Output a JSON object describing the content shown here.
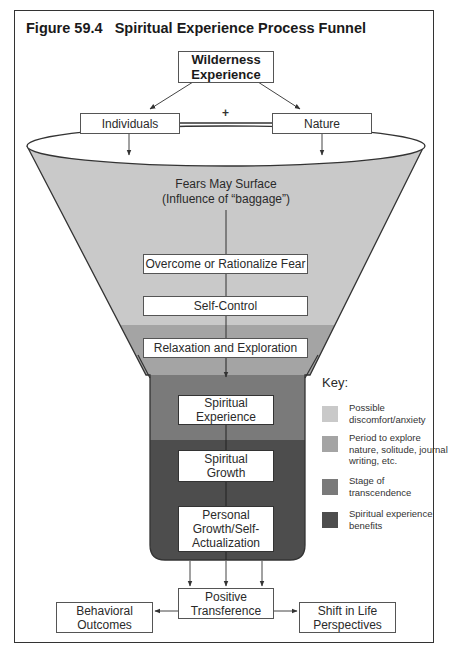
{
  "figure": {
    "title": "Figure 59.4   Spiritual Experience Process Funnel"
  },
  "top": {
    "source": "Wilderness\nExperience",
    "left_input": "Individuals",
    "right_input": "Nature",
    "combiner": "+"
  },
  "funnel": {
    "fears": "Fears May Surface\n(Influence of “baggage”)",
    "stages": [
      {
        "label": "Overcome or Rationalize Fear"
      },
      {
        "label": "Self-Control"
      },
      {
        "label": "Relaxation and Exploration"
      },
      {
        "label": "Spiritual\nExperience"
      },
      {
        "label": "Spiritual\nGrowth"
      },
      {
        "label": "Personal\nGrowth/Self-\nActualization"
      }
    ]
  },
  "outputs": {
    "center": "Positive\nTransference",
    "left": "Behavioral\nOutcomes",
    "right": "Shift in Life\nPerspectives"
  },
  "key": {
    "title": "Key:",
    "items": [
      {
        "label": "Possible discomfort/anxiety",
        "color": "#c9c9c9"
      },
      {
        "label": "Period to explore nature, solitude, journal writing, etc.",
        "color": "#a4a4a4"
      },
      {
        "label": "Stage of transcendence",
        "color": "#7a7a7a"
      },
      {
        "label": "Spiritual experience benefits",
        "color": "#4d4d4d"
      }
    ]
  },
  "colors": {
    "band_discomfort": "#c9c9c9",
    "band_explore": "#a4a4a4",
    "band_transcendence": "#7a7a7a",
    "band_benefits": "#4d4d4d",
    "outline": "#333333"
  }
}
